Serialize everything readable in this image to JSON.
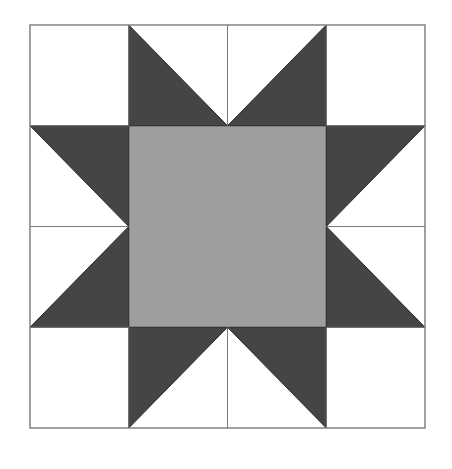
{
  "figure": {
    "kind": "quilt-block-diagram",
    "name": "Sawtooth Star quilt block",
    "canvas": {
      "width": 452,
      "height": 469
    },
    "background_color": "#ffffff"
  },
  "palette": {
    "background": "#ffffff",
    "patch_white": "#ffffff",
    "patch_dark": "#454545",
    "patch_light_gray": "#9e9e9e",
    "outline": "#7a7a7a",
    "outline_dark": "#2b2b2b"
  },
  "block": {
    "label": "Sawtooth Star",
    "frame": {
      "x": 30,
      "y": 25,
      "width": 395,
      "height": 403
    },
    "grid": {
      "columns": 4,
      "rows": 4,
      "cell_width": 98.75,
      "cell_height": 100.75
    },
    "guide_lines": {
      "vertical_x": [
        128.75,
        227.5,
        326.25
      ],
      "horizontal_y": [
        125.75,
        226.5,
        327.25
      ]
    }
  },
  "patches": {
    "corner_squares": [
      {
        "name": "corner-top-left",
        "color": "#ffffff",
        "x": 30,
        "y": 25,
        "width": 98.75,
        "height": 100.75
      },
      {
        "name": "corner-top-right",
        "color": "#ffffff",
        "x": 326.25,
        "y": 25,
        "width": 98.75,
        "height": 100.75
      },
      {
        "name": "corner-bottom-left",
        "color": "#ffffff",
        "x": 30,
        "y": 327.25,
        "width": 98.75,
        "height": 100.75
      },
      {
        "name": "corner-bottom-right",
        "color": "#ffffff",
        "x": 326.25,
        "y": 327.25,
        "width": 98.75,
        "height": 100.75
      }
    ],
    "center_square": {
      "name": "center-square",
      "color": "#9e9e9e",
      "x": 128.75,
      "y": 125.75,
      "width": 197.5,
      "height": 201.5
    },
    "star_points": [
      {
        "name": "star-point-top-left",
        "color": "#454545",
        "points": "128.75,25 128.75,125.75 227.5,125.75"
      },
      {
        "name": "star-point-top-right",
        "color": "#454545",
        "points": "326.25,25 326.25,125.75 227.5,125.75"
      },
      {
        "name": "star-point-left-upper",
        "color": "#454545",
        "points": "30,125.75 128.75,125.75 128.75,226.5"
      },
      {
        "name": "star-point-left-lower",
        "color": "#454545",
        "points": "30,327.25 128.75,327.25 128.75,226.5"
      },
      {
        "name": "star-point-right-upper",
        "color": "#454545",
        "points": "425,125.75 326.25,125.75 326.25,226.5"
      },
      {
        "name": "star-point-right-lower",
        "color": "#454545",
        "points": "425,327.25 326.25,327.25 326.25,226.5"
      },
      {
        "name": "star-point-bottom-left",
        "color": "#454545",
        "points": "128.75,428 128.75,327.25 227.5,327.25"
      },
      {
        "name": "star-point-bottom-right",
        "color": "#454545",
        "points": "326.25,428 326.25,327.25 227.5,327.25"
      }
    ],
    "seam_lines": [
      {
        "name": "seam-vertical-col1-top",
        "x1": 128.75,
        "y1": 25,
        "x2": 128.75,
        "y2": 125.75
      },
      {
        "name": "seam-vertical-center-top",
        "x1": 227.5,
        "y1": 25,
        "x2": 227.5,
        "y2": 125.75
      },
      {
        "name": "seam-vertical-col3-top",
        "x1": 326.25,
        "y1": 25,
        "x2": 326.25,
        "y2": 125.75
      },
      {
        "name": "seam-vertical-col1-bottom",
        "x1": 128.75,
        "y1": 327.25,
        "x2": 128.75,
        "y2": 428
      },
      {
        "name": "seam-vertical-center-bot",
        "x1": 227.5,
        "y1": 327.25,
        "x2": 227.5,
        "y2": 428
      },
      {
        "name": "seam-vertical-col3-bottom",
        "x1": 326.25,
        "y1": 327.25,
        "x2": 326.25,
        "y2": 428
      },
      {
        "name": "seam-horizontal-row1-left",
        "x1": 30,
        "y1": 125.75,
        "x2": 128.75,
        "y2": 125.75
      },
      {
        "name": "seam-horizontal-mid-left",
        "x1": 30,
        "y1": 226.5,
        "x2": 128.75,
        "y2": 226.5
      },
      {
        "name": "seam-horizontal-row3-left",
        "x1": 30,
        "y1": 327.25,
        "x2": 128.75,
        "y2": 327.25
      },
      {
        "name": "seam-horizontal-row1-right",
        "x1": 326.25,
        "y1": 125.75,
        "x2": 425,
        "y2": 125.75
      },
      {
        "name": "seam-horizontal-mid-right",
        "x1": 326.25,
        "y1": 226.5,
        "x2": 425,
        "y2": 226.5
      },
      {
        "name": "seam-horizontal-row3-right",
        "x1": 326.25,
        "y1": 327.25,
        "x2": 425,
        "y2": 327.25
      }
    ]
  }
}
